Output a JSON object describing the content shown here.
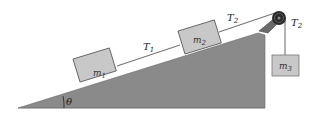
{
  "diagram": {
    "title": "",
    "colors": {
      "incline": "#8a8a8a",
      "block": "#c8c8c8",
      "block_border": "#555555",
      "rope": "#666666",
      "pulley": "#222222",
      "background": "#ffffff"
    },
    "labels": {
      "angle": "θ",
      "m1": "m",
      "m1_sub": "1",
      "m2": "m",
      "m2_sub": "2",
      "m3": "m",
      "m3_sub": "3",
      "T1": "T",
      "T1_sub": "1",
      "T2_incline": "T",
      "T2_incline_sub": "2",
      "T2_hanging": "T",
      "T2_hanging_sub": "2"
    }
  }
}
